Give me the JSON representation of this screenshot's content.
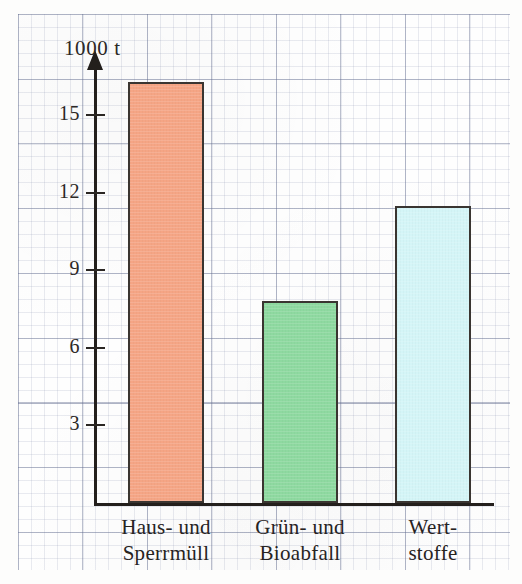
{
  "chart_data": {
    "type": "bar",
    "title": "",
    "subtitle": "",
    "unit_label": "1000 t",
    "xlabel": "",
    "ylabel": "1000 t",
    "categories": [
      "Haus- und Sperrmüll",
      "Grün- und Bioabfall",
      "Wert- stoffe"
    ],
    "category_lines": [
      [
        "Haus- und",
        "Sperrmüll"
      ],
      [
        "Grün- und",
        "Bioabfall"
      ],
      [
        "Wert-",
        "stoffe"
      ]
    ],
    "values": [
      16.3,
      7.8,
      11.5
    ],
    "bar_colors": [
      "#F5A585",
      "#8ED9A0",
      "#D4F5F7"
    ],
    "bar_border_color": "#3A3531",
    "ylim": [
      0,
      17
    ],
    "ytick_values": [
      15,
      12,
      9,
      6,
      3
    ],
    "ytick_labels": [
      "15",
      "12",
      "9",
      "6",
      "3"
    ],
    "grid": true,
    "grid_style": "graph-paper",
    "legend": "none",
    "axis_color": "#231F1C",
    "background": "#FEFEFE"
  },
  "axis": {
    "unit": "1000 t",
    "ticks": [
      {
        "label": "15",
        "value": 15
      },
      {
        "label": "12",
        "value": 12
      },
      {
        "label": "9",
        "value": 9
      },
      {
        "label": "6",
        "value": 6
      },
      {
        "label": "3",
        "value": 3
      }
    ]
  },
  "bars": [
    {
      "line1": "Haus- und",
      "line2": "Sperrmüll",
      "value": 16.3,
      "color": "#F5A585"
    },
    {
      "line1": "Grün- und",
      "line2": "Bioabfall",
      "value": 7.8,
      "color": "#8ED9A0"
    },
    {
      "line1": "Wert-",
      "line2": "stoffe",
      "value": 11.5,
      "color": "#D4F5F7"
    }
  ]
}
